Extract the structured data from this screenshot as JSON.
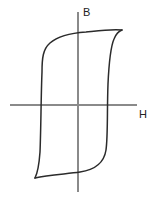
{
  "figure": {
    "name": "magnetic-hysteresis-loop",
    "background_color": "#ffffff",
    "width": 160,
    "height": 199,
    "axis_color": "#8a8a8a",
    "curve_color": "#2b2b2b"
  },
  "axes": {
    "vertical": {
      "label": "B",
      "label_x": 83,
      "label_y": 8,
      "x": 78,
      "y_top": 12,
      "y_bottom": 192
    },
    "horizontal": {
      "label": "H",
      "label_x": 139,
      "label_y": 110,
      "y": 105,
      "x_left": 10,
      "x_right": 137
    }
  },
  "chart_data": {
    "type": "line",
    "title": "",
    "xlabel": "H",
    "ylabel": "B",
    "grid": false,
    "legend": null,
    "annotations": [],
    "xlim": [
      -68,
      59
    ],
    "ylim": [
      -87,
      93
    ],
    "series": [
      {
        "name": "upper-branch",
        "description": "Descending branch of the hysteresis loop, traced right-to-left across the top, turning down on the left side to the lower-left tip.",
        "path": "M 122 30 C 110 29 96 31 86 32 C 72 33 58 36 50 43 C 43 49 42 58 42 72 C 41 96 41 128 40 152 C 39 166 37 174 35 178",
        "points": [
          [
            122,
            30
          ],
          [
            110,
            30
          ],
          [
            96,
            31
          ],
          [
            86,
            32
          ],
          [
            72,
            34
          ],
          [
            58,
            37
          ],
          [
            50,
            43
          ],
          [
            44,
            52
          ],
          [
            42,
            72
          ],
          [
            41,
            96
          ],
          [
            41,
            128
          ],
          [
            40,
            152
          ],
          [
            37,
            170
          ],
          [
            35,
            178
          ]
        ]
      },
      {
        "name": "lower-branch",
        "description": "Ascending branch of the hysteresis loop, traced left-to-right along the bottom, turning up on the right side to the upper-right tip.",
        "path": "M 35 178 C 48 175 66 174 80 172 C 94 170 104 163 106 150 C 108 136 107 110 108 84 C 109 62 111 46 114 39 C 116 34 119 31 122 30",
        "points": [
          [
            35,
            178
          ],
          [
            48,
            175
          ],
          [
            66,
            174
          ],
          [
            80,
            172
          ],
          [
            94,
            169
          ],
          [
            103,
            161
          ],
          [
            106,
            150
          ],
          [
            107,
            128
          ],
          [
            107,
            105
          ],
          [
            108,
            84
          ],
          [
            110,
            58
          ],
          [
            113,
            42
          ],
          [
            118,
            32
          ],
          [
            122,
            30
          ]
        ]
      }
    ],
    "key_features": {
      "saturation_positive": [
        122,
        30
      ],
      "saturation_negative": [
        35,
        178
      ],
      "remanence_positive_y": 32,
      "remanence_negative_y": 172,
      "coercivity_left_x": 42,
      "coercivity_right_x": 106,
      "origin": [
        78,
        105
      ]
    }
  }
}
